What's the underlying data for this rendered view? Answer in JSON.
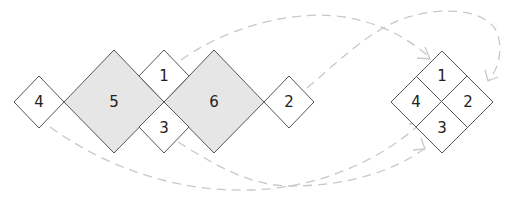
{
  "diagram": {
    "colors": {
      "small_fill": "#ffffff",
      "big_fill": "#e6e6e6",
      "stroke": "#555555",
      "arrow": "#c8c8c8"
    },
    "source_pieces": [
      {
        "id": "4",
        "label": "4",
        "size": "small"
      },
      {
        "id": "5",
        "label": "5",
        "size": "large"
      },
      {
        "id": "1",
        "label": "1",
        "size": "small"
      },
      {
        "id": "3",
        "label": "3",
        "size": "small"
      },
      {
        "id": "6",
        "label": "6",
        "size": "large"
      },
      {
        "id": "2",
        "label": "2",
        "size": "small"
      }
    ],
    "assembled_square": {
      "cells": [
        {
          "position": "top",
          "label": "1"
        },
        {
          "position": "right",
          "label": "2"
        },
        {
          "position": "bottom",
          "label": "3"
        },
        {
          "position": "left",
          "label": "4"
        }
      ]
    },
    "arrows": [
      {
        "from": "1",
        "to": "assembled 1",
        "style": "dashed"
      },
      {
        "from": "2",
        "to": "assembled 2",
        "style": "dashed"
      },
      {
        "from": "3",
        "to": "assembled 3",
        "style": "dashed"
      },
      {
        "from": "4",
        "to": "assembled 4",
        "style": "dashed"
      }
    ]
  }
}
